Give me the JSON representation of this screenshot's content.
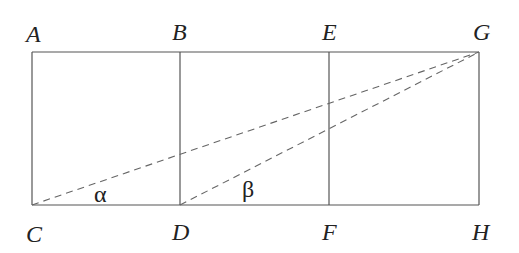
{
  "diagram": {
    "points": {
      "A": {
        "label": "A",
        "x": 32,
        "y": 52
      },
      "B": {
        "label": "B",
        "x": 180,
        "y": 52
      },
      "E": {
        "label": "E",
        "x": 329,
        "y": 52
      },
      "G": {
        "label": "G",
        "x": 479,
        "y": 52
      },
      "C": {
        "label": "C",
        "x": 32,
        "y": 205
      },
      "D": {
        "label": "D",
        "x": 180,
        "y": 205
      },
      "F": {
        "label": "F",
        "x": 329,
        "y": 205
      },
      "H": {
        "label": "H",
        "x": 479,
        "y": 205
      }
    },
    "solid_segments": [
      "AG",
      "CH",
      "AC",
      "BD",
      "EF",
      "GH"
    ],
    "dashed_segments": [
      "CG",
      "DG"
    ],
    "angles": {
      "alpha": {
        "symbol": "α",
        "at": "C",
        "between": "CH and CG"
      },
      "beta": {
        "symbol": "β",
        "at": "D",
        "between": "DH and DG"
      }
    },
    "colors": {
      "line": "#555555",
      "dash": "#666666",
      "text": "#222222"
    }
  }
}
